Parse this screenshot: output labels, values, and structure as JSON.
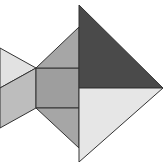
{
  "figure": {
    "stroke": "#333333",
    "pieces": [
      {
        "name": "tail-top-triangle",
        "points": "0,48 36,68 0,88",
        "fill": "#e2e2e2"
      },
      {
        "name": "tail-parallelogram",
        "points": "0,88 36,68 36,108 0,128",
        "fill": "#bdbdbd"
      },
      {
        "name": "body-square",
        "points": "36,68 79,68 79,108 36,108",
        "fill": "#9e9e9e"
      },
      {
        "name": "upper-fin-triangle",
        "points": "36,68 79,27 79,68",
        "fill": "#a6a6a6"
      },
      {
        "name": "lower-fin-triangle",
        "points": "36,108 79,108 79,148",
        "fill": "#a6a6a6"
      },
      {
        "name": "head-dark-triangle",
        "points": "79,5 79,88 163,88",
        "fill": "#4a4a4a"
      },
      {
        "name": "head-light-triangle",
        "points": "79,88 163,88 79,162",
        "fill": "#e6e6e6"
      }
    ]
  }
}
